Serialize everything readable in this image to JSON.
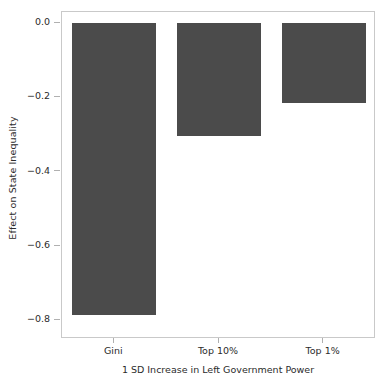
{
  "chart_data": {
    "type": "bar",
    "title": "",
    "subtitle": "",
    "categories": [
      "Gini",
      "Top 10%",
      "Top 1%"
    ],
    "values": [
      -0.785,
      -0.305,
      -0.215
    ],
    "xlabel": "1 SD Increase in Left Government Power",
    "ylabel": "Effect on State Inequality",
    "ylim": [
      -0.85,
      0.03
    ],
    "yticks": [
      0.0,
      -0.2,
      -0.4,
      -0.6,
      -0.8
    ],
    "ytick_labels": [
      "0.0",
      "−0.2",
      "−0.4",
      "−0.6",
      "−0.8"
    ],
    "xtick_labels": [
      "Gini",
      "Top 10%",
      "Top 1%"
    ],
    "grid": false,
    "legend": null,
    "bar_color": "#4b4b4b",
    "axis_color": "#c9c9c9",
    "background": "#ffffff",
    "series": [
      {
        "name": "Effect on State Inequality",
        "values": [
          -0.785,
          -0.305,
          -0.215
        ]
      }
    ]
  }
}
